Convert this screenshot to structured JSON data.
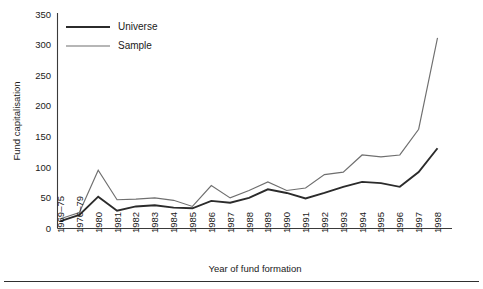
{
  "chart_data": {
    "type": "line",
    "title": "",
    "xlabel": "Year of fund formation",
    "ylabel": "Fund capitalisation",
    "ylim": [
      0,
      350
    ],
    "yticks": [
      0,
      50,
      100,
      150,
      200,
      250,
      300,
      350
    ],
    "grid": false,
    "legend_position": "top-left",
    "categories": [
      "1969–75",
      "1976–79",
      "1980",
      "1981",
      "1982",
      "1983",
      "1984",
      "1985",
      "1986",
      "1987",
      "1988",
      "1989",
      "1990",
      "1991",
      "1992",
      "1993",
      "1994",
      "1995",
      "1996",
      "1997",
      "1998"
    ],
    "series": [
      {
        "name": "Universe",
        "color": "#2b2b2b",
        "values": [
          12,
          22,
          52,
          29,
          36,
          38,
          34,
          33,
          45,
          42,
          50,
          64,
          58,
          49,
          58,
          68,
          76,
          74,
          68,
          92,
          131
        ]
      },
      {
        "name": "Sample",
        "color": "#6f6f6f",
        "values": [
          16,
          26,
          95,
          47,
          48,
          50,
          46,
          36,
          70,
          50,
          62,
          76,
          62,
          66,
          88,
          92,
          120,
          117,
          120,
          162,
          311
        ]
      }
    ]
  },
  "axes": {
    "y_title": "Fund capitalisation",
    "x_title": "Year of fund formation"
  },
  "legend": {
    "entries": [
      {
        "label": "Universe"
      },
      {
        "label": "Sample"
      }
    ]
  },
  "colors": {
    "universe": "#2b2b2b",
    "sample": "#6f6f6f",
    "axis": "#3a3a3a",
    "text": "#1a1a1a",
    "background": "#ffffff"
  }
}
